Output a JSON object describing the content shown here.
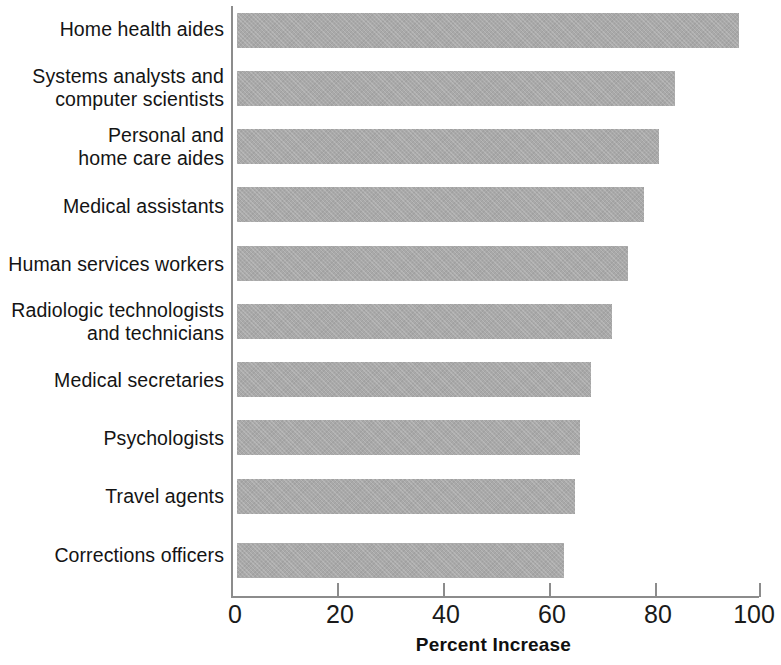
{
  "chart_data": {
    "type": "bar",
    "orientation": "horizontal",
    "title": "",
    "xlabel": "Percent Increase",
    "ylabel": "",
    "xlim": [
      0,
      100
    ],
    "xticks": [
      0,
      20,
      40,
      60,
      80,
      100
    ],
    "xtick_labels": [
      "0",
      "20",
      "40",
      "60",
      "80",
      "100"
    ],
    "grid": false,
    "legend": null,
    "bar_color": "#a9a9a9",
    "axis_color": "#8c8c8c",
    "categories": [
      "Home health aides",
      "Systems analysts and\ncomputer scientists",
      "Personal and\nhome care aides",
      "Medical assistants",
      "Human services workers",
      "Radiologic technologists\nand technicians",
      "Medical secretaries",
      "Psychologists",
      "Travel agents",
      "Corrections officers"
    ],
    "values": [
      95,
      83,
      80,
      77,
      74,
      71,
      67,
      65,
      64,
      62
    ]
  }
}
